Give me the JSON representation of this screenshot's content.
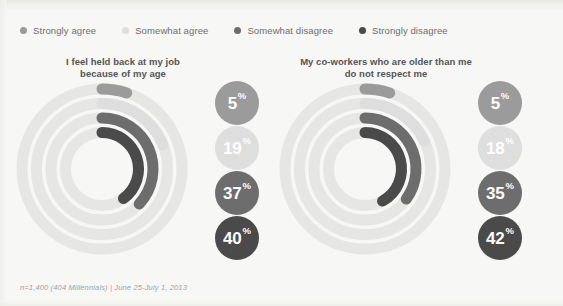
{
  "legend": {
    "items": [
      {
        "label": "Strongly agree",
        "color": "#9b9b9b"
      },
      {
        "label": "Somewhat agree",
        "color": "#dedede"
      },
      {
        "label": "Somewhat disagree",
        "color": "#6d6d6d"
      },
      {
        "label": "Strongly disagree",
        "color": "#4a4a4a"
      }
    ]
  },
  "footnote": "n=1,400 (404 Millennials) | June 25-July 1, 2013",
  "charts": [
    {
      "title_line1": "I feel held back at my job",
      "title_line2": "because of my age",
      "values": [
        {
          "label": "5",
          "suffix": "%"
        },
        {
          "label": "19",
          "suffix": "%"
        },
        {
          "label": "37",
          "suffix": "%"
        },
        {
          "label": "40",
          "suffix": "%"
        }
      ]
    },
    {
      "title_line1": "My co-workers who are older than me",
      "title_line2": "do not respect me",
      "values": [
        {
          "label": "5",
          "suffix": "%"
        },
        {
          "label": "18",
          "suffix": "%"
        },
        {
          "label": "35",
          "suffix": "%"
        },
        {
          "label": "42",
          "suffix": "%"
        }
      ]
    }
  ],
  "chart_data": {
    "type": "pie",
    "chart_style": "radial-progress-rings",
    "subtitle": "",
    "xlabel": "",
    "ylabel": "",
    "unit": "percent",
    "track_color": "#e6e6e4",
    "background_color": "#f7f7f5",
    "legend_position": "top",
    "grid": false,
    "categories": [
      "Strongly agree",
      "Somewhat agree",
      "Somewhat disagree",
      "Strongly disagree"
    ],
    "category_colors": [
      "#9b9b9b",
      "#dedede",
      "#6d6d6d",
      "#4a4a4a"
    ],
    "ring_order_outer_to_inner": [
      "Strongly agree",
      "Somewhat agree",
      "Somewhat disagree",
      "Strongly disagree"
    ],
    "series": [
      {
        "name": "I feel held back at my job because of my age",
        "values": [
          5,
          19,
          37,
          40
        ]
      },
      {
        "name": "My co-workers who are older than me do not respect me",
        "values": [
          5,
          18,
          35,
          42
        ]
      }
    ],
    "annotations": [
      "n=1,400 (404 Millennials) | June 25-July 1, 2013"
    ]
  }
}
